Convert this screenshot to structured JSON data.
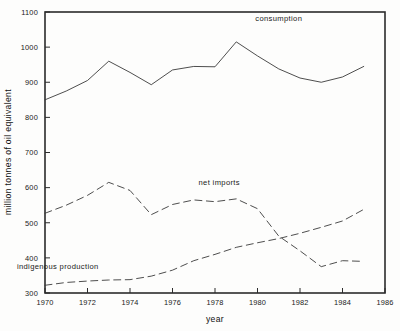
{
  "chart_data": {
    "type": "line",
    "title": "",
    "xlabel": "year",
    "ylabel": "million tonnes of oil equivalent",
    "xlim": [
      1970,
      1986
    ],
    "ylim": [
      300,
      1100
    ],
    "grid": false,
    "legend_position": "inline-annotations",
    "x": [
      1970,
      1971,
      1972,
      1973,
      1974,
      1975,
      1976,
      1977,
      1978,
      1979,
      1980,
      1981,
      1982,
      1983,
      1984,
      1985
    ],
    "xticks": [
      "1970",
      "1972",
      "1974",
      "1976",
      "1978",
      "1980",
      "1982",
      "1984",
      "1986"
    ],
    "xtick_values": [
      1970,
      1972,
      1974,
      1976,
      1978,
      1980,
      1982,
      1984,
      1986
    ],
    "yticks": [
      "300",
      "400",
      "500",
      "600",
      "700",
      "800",
      "900",
      "1000",
      "1100"
    ],
    "ytick_values": [
      300,
      400,
      500,
      600,
      700,
      800,
      900,
      1000,
      1100
    ],
    "series": [
      {
        "name": "consumption",
        "style": "solid",
        "label_x": 1981.0,
        "label_y": 1075,
        "values": [
          850,
          875,
          905,
          960,
          928,
          893,
          935,
          945,
          944,
          1015,
          975,
          938,
          912,
          900,
          915,
          945
        ]
      },
      {
        "name": "net imports",
        "style": "dashed",
        "label_x": 1978.2,
        "label_y": 607,
        "values": [
          527,
          550,
          578,
          615,
          592,
          523,
          552,
          565,
          560,
          568,
          540,
          462,
          420,
          375,
          392,
          390
        ]
      },
      {
        "name": "indigenous production",
        "style": "dashed",
        "label_x": 1970.6,
        "label_y": 368,
        "values": [
          322,
          330,
          334,
          337,
          338,
          348,
          365,
          392,
          410,
          430,
          443,
          455,
          470,
          487,
          505,
          538
        ]
      }
    ]
  }
}
